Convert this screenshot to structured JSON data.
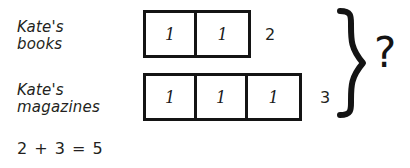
{
  "diagram": {
    "rows": [
      {
        "id": "books",
        "label": "Kate's\nbooks",
        "cells": [
          "1",
          "1"
        ],
        "total": "2"
      },
      {
        "id": "magazines",
        "label": "Kate's\nmagazines",
        "cells": [
          "1",
          "1",
          "1"
        ],
        "total": "3"
      }
    ],
    "brace": {
      "name": "right-curly-brace",
      "unknown_label": "?"
    },
    "equation": "2 + 3 = 5",
    "colors": {
      "ink": "#141414",
      "text": "#231f20",
      "background": "#ffffff"
    }
  }
}
